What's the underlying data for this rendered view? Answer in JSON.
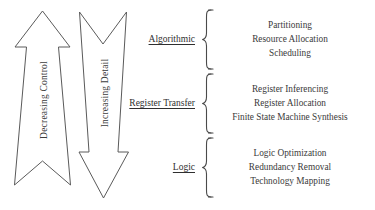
{
  "figure": {
    "background_color": "#ffffff",
    "stroke_color": "#5a5a5a",
    "text_color": "#3a3a3a"
  },
  "arrows": [
    {
      "id": "decreasing-control",
      "label": "Decreasing Control",
      "direction": "up"
    },
    {
      "id": "increasing-detail",
      "label": "Increasing Detail",
      "direction": "down"
    }
  ],
  "levels": [
    {
      "id": "algorithmic",
      "label": "Algorithmic",
      "tasks": [
        "Partitioning",
        "Resource Allocation",
        "Scheduling"
      ]
    },
    {
      "id": "register-transfer",
      "label": "Register Transfer",
      "tasks": [
        "Register Inferencing",
        "Register Allocation",
        "Finite State Machine Synthesis"
      ]
    },
    {
      "id": "logic",
      "label": "Logic",
      "tasks": [
        "Logic Optimization",
        "Redundancy Removal",
        "Technology Mapping"
      ]
    }
  ]
}
